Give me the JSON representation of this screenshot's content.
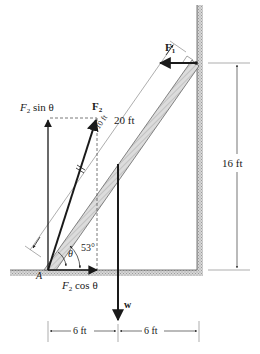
{
  "figure": {
    "labels": {
      "f1": "F",
      "f1_sub": "1",
      "f2": "F",
      "f2_sub": "2",
      "f2_sin": "F",
      "f2_sin_sub": "2",
      "f2_sin_suffix": " sin θ",
      "f2_cos": "F",
      "f2_cos_sub": "2",
      "f2_cos_suffix": " cos θ",
      "ladder_length": "20 ft",
      "height": "16 ft",
      "weight": "w",
      "point_a": "A",
      "theta": "θ",
      "angle": "53°",
      "mid_ladder_mark": "10 ft",
      "dim_left": "6 ft",
      "dim_right": "6 ft"
    },
    "colors": {
      "ink": "#1a1a1a",
      "hatch": "#b8b8b8",
      "light_line": "#8a8a8a"
    }
  }
}
